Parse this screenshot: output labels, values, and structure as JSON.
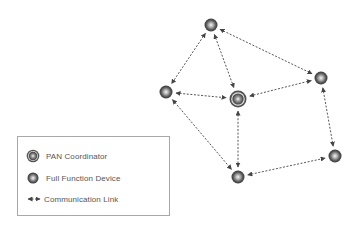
{
  "diagram": {
    "type": "star-mesh network topology",
    "nodes": [
      {
        "id": "top",
        "kind": "full_function_device",
        "x": 211,
        "y": 25
      },
      {
        "id": "left",
        "kind": "full_function_device",
        "x": 166,
        "y": 92
      },
      {
        "id": "center",
        "kind": "pan_coordinator",
        "x": 238,
        "y": 99
      },
      {
        "id": "right_top",
        "kind": "full_function_device",
        "x": 321,
        "y": 78
      },
      {
        "id": "right_bottom",
        "kind": "full_function_device",
        "x": 335,
        "y": 156
      },
      {
        "id": "bottom",
        "kind": "full_function_device",
        "x": 238,
        "y": 177
      }
    ],
    "links": [
      {
        "from": "top",
        "to": "left"
      },
      {
        "from": "top",
        "to": "center"
      },
      {
        "from": "top",
        "to": "right_top"
      },
      {
        "from": "left",
        "to": "center"
      },
      {
        "from": "left",
        "to": "bottom"
      },
      {
        "from": "right_top",
        "to": "center"
      },
      {
        "from": "right_top",
        "to": "right_bottom"
      },
      {
        "from": "center",
        "to": "bottom"
      },
      {
        "from": "bottom",
        "to": "right_bottom"
      }
    ],
    "colors": {
      "link": "#555555",
      "node_dark": "#4a4a4a",
      "node_light": "#f0f0f0",
      "legend_border": "#a8a8a8"
    }
  },
  "legend": {
    "items": [
      {
        "icon": "pan-coordinator-icon",
        "label": "PAN Coordinator"
      },
      {
        "icon": "full-function-device-icon",
        "label": "Full Function Device"
      },
      {
        "icon": "communication-link-icon",
        "label": "Communication Link"
      }
    ]
  }
}
